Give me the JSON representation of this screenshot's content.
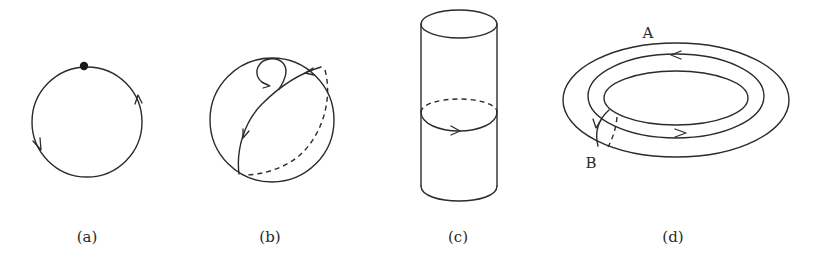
{
  "figure": {
    "panels": [
      {
        "id": "a",
        "caption": "(a)",
        "shape": "circle",
        "description": "Closed loop on a circle with a base point and two orientation arrows"
      },
      {
        "id": "b",
        "caption": "(b)",
        "shape": "sphere",
        "description": "Sphere with a great-circle path (front solid, back dashed) and a small contractible loop"
      },
      {
        "id": "c",
        "caption": "(c)",
        "shape": "cylinder",
        "description": "Cylinder with an oriented loop around its waist (back half dashed)"
      },
      {
        "id": "d",
        "caption": "(d)",
        "shape": "torus",
        "description": "Torus with loop A around the hole and loop B around the tube",
        "labels": {
          "A": "A",
          "B": "B"
        }
      }
    ],
    "colors": {
      "background": "#ffffff",
      "stroke": "#2b2b2b",
      "text": "#2a2a2a"
    }
  }
}
